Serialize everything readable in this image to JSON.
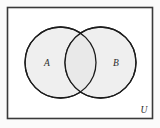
{
  "figure": {
    "kind": "venn-diagram",
    "universe": {
      "label": "U",
      "label_position": "bottom-right-inside",
      "border_color": "#3a3a3a",
      "fill_color": "#ffffff",
      "rect": {
        "x": 7,
        "y": 7,
        "width": 146,
        "height": 112
      }
    },
    "sets": [
      {
        "name": "set-a",
        "label": "A",
        "fill_color": "#efefef",
        "stroke_color": "#1c1c1c",
        "circle": {
          "cx": 60.5,
          "cy": 62.5,
          "r": 35.5
        },
        "label_position": {
          "x": 47,
          "y": 66
        }
      },
      {
        "name": "set-b",
        "label": "B",
        "fill_color": "#efefef",
        "stroke_color": "#1c1c1c",
        "circle": {
          "cx": 100.5,
          "cy": 62.5,
          "r": 35.5
        },
        "label_position": {
          "x": 116,
          "y": 66
        }
      }
    ],
    "intersection": {
      "name": "a-intersect-b",
      "label": "",
      "fill_color": "#e9e9e9"
    },
    "page_background": "#fbfbfb"
  }
}
